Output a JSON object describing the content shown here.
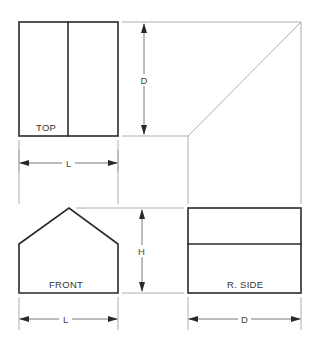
{
  "diagram": {
    "type": "orthographic-projection",
    "views": {
      "top": {
        "label": "TOP"
      },
      "front": {
        "label": "FRONT"
      },
      "right_side": {
        "label": "R. SIDE"
      }
    },
    "dimensions": {
      "top_depth": "D",
      "top_length": "L",
      "front_height": "H",
      "front_length": "L",
      "side_depth": "D"
    },
    "colors": {
      "object_line": "#2a2a2a",
      "projection_line": "#9a9a9a",
      "background": "#ffffff"
    }
  }
}
